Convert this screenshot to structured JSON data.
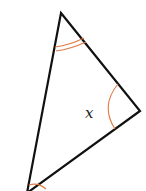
{
  "diagram": {
    "type": "triangle",
    "vertices": {
      "top": [
        61,
        13
      ],
      "right": [
        140,
        111
      ],
      "bottom": [
        27,
        193
      ]
    },
    "angle_marks": [
      {
        "vertex": "top",
        "arcs": 2
      },
      {
        "vertex": "right",
        "arcs": 1,
        "label": "x"
      },
      {
        "vertex": "bottom",
        "arcs": 1
      }
    ],
    "labels": {
      "angle_right": "x"
    },
    "colors": {
      "edge": "#111111",
      "arc": "#e07a45"
    }
  }
}
